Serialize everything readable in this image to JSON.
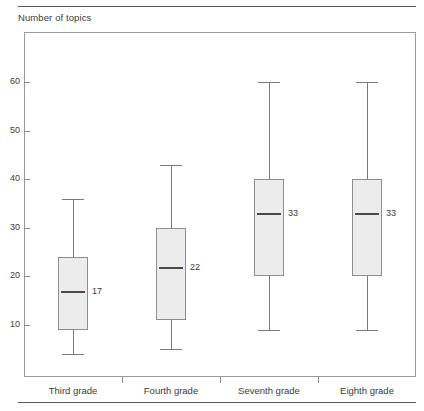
{
  "chart_data": {
    "type": "box",
    "title": "",
    "ylabel": "Number of topics",
    "xlabel": "",
    "ylim": [
      0,
      65
    ],
    "yticks": [
      10,
      20,
      30,
      40,
      50,
      60
    ],
    "ytick_labels": [
      "10",
      "20",
      "30",
      "40",
      "50",
      "60"
    ],
    "grid": false,
    "legend": "none",
    "categories": [
      "Third grade",
      "Fourth grade",
      "Seventh grade",
      "Eighth grade"
    ],
    "boxes": [
      {
        "category": "Third grade",
        "whisker_low": 4,
        "q1": 9,
        "median": 17,
        "q3": 24,
        "whisker_high": 36,
        "median_label": "17"
      },
      {
        "category": "Fourth grade",
        "whisker_low": 5,
        "q1": 11,
        "median": 22,
        "q3": 30,
        "whisker_high": 43,
        "median_label": "22"
      },
      {
        "category": "Seventh grade",
        "whisker_low": 9,
        "q1": 20,
        "median": 33,
        "q3": 40,
        "whisker_high": 60,
        "median_label": "33"
      },
      {
        "category": "Eighth grade",
        "whisker_low": 9,
        "q1": 20,
        "median": 33,
        "q3": 40,
        "whisker_high": 60,
        "median_label": "33"
      }
    ]
  },
  "axis": {
    "y_title": "Number of topics"
  },
  "colors": {
    "box_fill": "#ececec",
    "box_stroke": "#8d8d8d",
    "median_stroke": "#4a4a4a",
    "whisker_stroke": "#7a7a7a",
    "frame_stroke": "#9a9a9a",
    "rule_stroke": "#5a5a5a",
    "text": "#3b3b3b"
  }
}
